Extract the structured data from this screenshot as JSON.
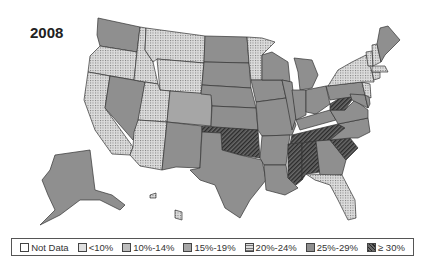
{
  "title": "2008",
  "colors": {
    "nodata": "#ffffff",
    "lt10": "#e0e0e0",
    "c10_14": "#bdbdbd",
    "c15_19": "#a6a6a6",
    "c20_24": "#c8c8c8",
    "c25_29": "#8f8f8f",
    "ge30": "#4a4a4a",
    "border": "#333333"
  },
  "legend": {
    "items": [
      {
        "key": "nodata",
        "label": "Not Data"
      },
      {
        "key": "lt10",
        "label": "<10%"
      },
      {
        "key": "c10_14",
        "label": "10%-14%"
      },
      {
        "key": "c15_19",
        "label": "15%-19%"
      },
      {
        "key": "c20_24",
        "label": "20%-24%"
      },
      {
        "key": "c25_29",
        "label": "25%-29%"
      },
      {
        "key": "ge30",
        "label": "≥ 30%"
      }
    ]
  },
  "states": {
    "WA": "c25_29",
    "OR": "c20_24",
    "CA": "c20_24",
    "NV": "c25_29",
    "ID": "c20_24",
    "MT": "c20_24",
    "WY": "c20_24",
    "UT": "c20_24",
    "AZ": "c20_24",
    "CO": "c15_19",
    "NM": "c25_29",
    "ND": "c25_29",
    "SD": "c25_29",
    "NE": "c25_29",
    "KS": "c25_29",
    "OK": "ge30",
    "TX": "c25_29",
    "MN": "c20_24",
    "IA": "c25_29",
    "MO": "c25_29",
    "AR": "c25_29",
    "LA": "c25_29",
    "WI": "c25_29",
    "IL": "c25_29",
    "MI": "c25_29",
    "IN": "c25_29",
    "OH": "c25_29",
    "KY": "c25_29",
    "TN": "ge30",
    "MS": "ge30",
    "AL": "ge30",
    "GA": "c25_29",
    "FL": "c20_24",
    "SC": "ge30",
    "NC": "c25_29",
    "VA": "c25_29",
    "WV": "ge30",
    "PA": "c25_29",
    "NY": "c20_24",
    "VT": "c20_24",
    "NH": "c20_24",
    "ME": "c25_29",
    "MA": "c20_24",
    "CT": "c20_24",
    "NJ": "c20_24",
    "DE": "c25_29",
    "MD": "c25_29",
    "AK": "c25_29",
    "HI": "c20_24"
  }
}
